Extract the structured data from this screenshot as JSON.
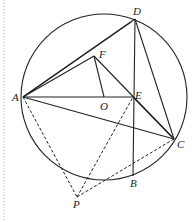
{
  "diagram": {
    "type": "geometry",
    "circle": {
      "center_label": "O",
      "cx": 104,
      "cy": 97,
      "r": 83
    },
    "points": {
      "A": {
        "label": "A",
        "x": 23,
        "y": 97
      },
      "B": {
        "label": "B",
        "x": 133,
        "y": 176
      },
      "C": {
        "label": "C",
        "x": 174,
        "y": 139
      },
      "D": {
        "label": "D",
        "x": 135,
        "y": 19
      },
      "E": {
        "label": "E",
        "x": 133,
        "y": 97
      },
      "F": {
        "label": "F",
        "x": 94,
        "y": 56
      },
      "O": {
        "label": "O",
        "x": 104,
        "y": 97
      },
      "P": {
        "label": "P",
        "x": 77,
        "y": 197
      }
    },
    "solid_segments": [
      "AD",
      "AF",
      "AE",
      "AC",
      "DE",
      "EB",
      "DC",
      "FO",
      "FE",
      "EC"
    ],
    "dashed_segments": [
      "AP",
      "PE",
      "PC"
    ],
    "colors": {
      "stroke": "#222222",
      "background": "#ffffff",
      "border": "#b0b0b0"
    }
  }
}
